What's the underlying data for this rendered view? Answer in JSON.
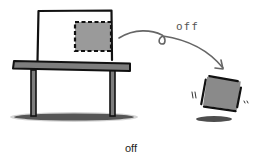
{
  "diagram": {
    "arc_label": "off",
    "caption": "off",
    "colors": {
      "ink": "#111111",
      "gray_fill": "#8a8a8a",
      "table_fill": "#7d7d7d",
      "shadow": "#3a3a3a",
      "arc": "#666666"
    },
    "elements": [
      {
        "name": "container-box",
        "description": "outlined box on table"
      },
      {
        "name": "dashed-square",
        "description": "gray square with dashed outline inside box (original position)"
      },
      {
        "name": "table",
        "description": "table with two legs"
      },
      {
        "name": "arc-arrow",
        "description": "curved arrow with loop labeled off"
      },
      {
        "name": "falling-square",
        "description": "tilted gray square with motion marks"
      },
      {
        "name": "ground-shadow",
        "description": "shadows under table and falling square"
      }
    ]
  }
}
